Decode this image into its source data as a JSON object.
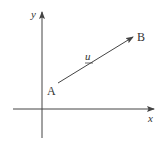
{
  "diagram": {
    "type": "vector-on-axes",
    "colors": {
      "stroke": "#444444",
      "text": "#333333",
      "background": "#ffffff"
    },
    "axes": {
      "x_label": "x",
      "y_label": "y",
      "origin": [
        42,
        109
      ],
      "x_axis": {
        "from": [
          13,
          109
        ],
        "to": [
          155,
          109
        ]
      },
      "y_axis": {
        "from": [
          42,
          138
        ],
        "to": [
          42,
          11
        ]
      }
    },
    "vector": {
      "label": "u",
      "label_underlined": true,
      "start_point": {
        "label": "A",
        "pos": [
          58,
          83
        ]
      },
      "end_point": {
        "label": "B",
        "pos": [
          133,
          37
        ]
      }
    }
  }
}
